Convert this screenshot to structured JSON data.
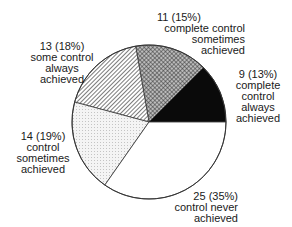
{
  "chart_data": {
    "type": "pie",
    "title": "",
    "total": 72,
    "start_angle_deg": 0,
    "direction": "counterclockwise",
    "slices": [
      {
        "name": "complete control always achieved",
        "value": 9,
        "percent": 13,
        "fill": "black",
        "label_lines": [
          "9 (13%)",
          "complete",
          "control",
          "always",
          "achieved"
        ]
      },
      {
        "name": "complete control sometimes achieved",
        "value": 11,
        "percent": 15,
        "fill": "crosshatch",
        "label_lines": [
          "11 (15%)",
          "complete control",
          "sometimes",
          "achieved"
        ]
      },
      {
        "name": "some control always achieved",
        "value": 13,
        "percent": 18,
        "fill": "diagonal",
        "label_lines": [
          "13 (18%)",
          "some control",
          "always",
          "achieved"
        ]
      },
      {
        "name": "control sometimes achieved",
        "value": 14,
        "percent": 19,
        "fill": "dotted",
        "label_lines": [
          "14 (19%)",
          "control",
          "sometimes",
          "achieved"
        ]
      },
      {
        "name": "control never achieved",
        "value": 25,
        "percent": 35,
        "fill": "white",
        "label_lines": [
          "25 (35%)",
          "control never",
          "achieved"
        ]
      }
    ]
  }
}
